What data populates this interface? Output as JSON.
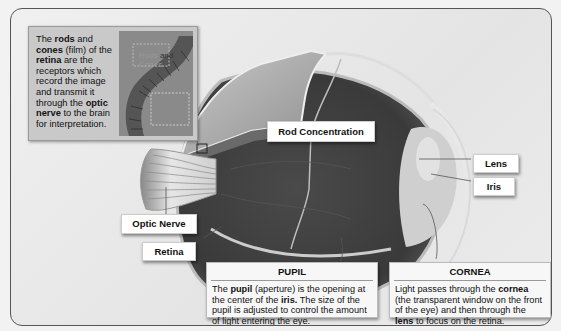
{
  "inset": {
    "text_parts": [
      {
        "t": "The ",
        "b": false
      },
      {
        "t": "rods",
        "b": true
      },
      {
        "t": " and ",
        "b": false
      },
      {
        "t": "cones",
        "b": true
      },
      {
        "t": " (film) of the ",
        "b": false
      },
      {
        "t": "retina",
        "b": true
      },
      {
        "t": " are the receptors which record the image and transmit it through the ",
        "b": false
      },
      {
        "t": "optic nerve",
        "b": true
      },
      {
        "t": " to the brain for interpretation.",
        "b": false
      }
    ],
    "image_label_1": "Rods",
    "image_label_2": "and",
    "image_label_3": "Cones"
  },
  "labels": {
    "rod_concentration": "Rod Concentration",
    "lens": "Lens",
    "iris": "Iris",
    "optic_nerve": "Optic Nerve",
    "retina": "Retina"
  },
  "pupil": {
    "title": "PUPIL",
    "text_parts": [
      {
        "t": "The ",
        "b": false
      },
      {
        "t": "pupil",
        "b": true
      },
      {
        "t": " (aperture) is the opening at the center of the ",
        "b": false
      },
      {
        "t": "iris.",
        "b": true
      },
      {
        "t": " The size of the pupil is adjusted to control the amount of light entering the eye.",
        "b": false
      }
    ]
  },
  "cornea": {
    "title": "CORNEA",
    "text_parts": [
      {
        "t": "Light passes through the ",
        "b": false
      },
      {
        "t": "cornea",
        "b": true
      },
      {
        "t": " (the transparent window on the front of the eye) and then through the ",
        "b": false
      },
      {
        "t": "lens",
        "b": true
      },
      {
        "t": " to focus on the retina.",
        "b": false
      }
    ]
  }
}
